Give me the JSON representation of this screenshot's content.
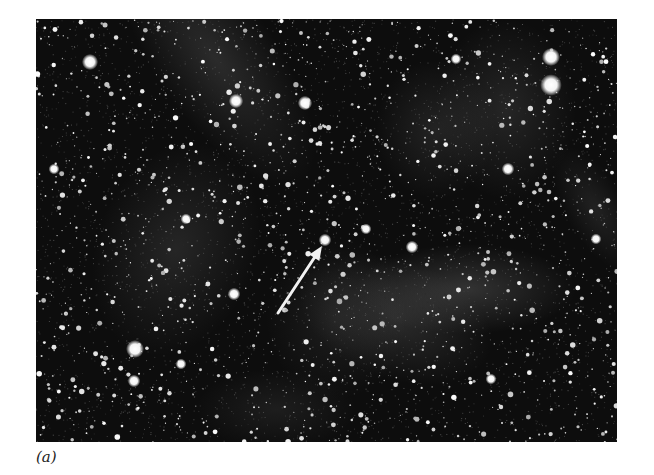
{
  "figure": {
    "panel_label": "(a)",
    "image": {
      "x": 36,
      "y": 19,
      "width": 581,
      "height": 423,
      "background_color": "#0d0d0d",
      "star_color": "#ffffff",
      "nebula_color": "#8a8a8a"
    },
    "arrow": {
      "color": "#f2f2f2",
      "tail": [
        242,
        294
      ],
      "head": [
        286,
        227
      ],
      "target_star": [
        289,
        221
      ]
    },
    "bright_stars": [
      [
        54,
        43,
        4.5
      ],
      [
        99,
        330,
        5
      ],
      [
        200,
        82,
        4
      ],
      [
        269,
        84,
        4
      ],
      [
        515,
        66,
        6
      ],
      [
        515,
        38,
        5
      ],
      [
        98,
        362,
        3.5
      ],
      [
        198,
        275,
        3.5
      ],
      [
        18,
        150,
        3
      ],
      [
        376,
        228,
        3.5
      ],
      [
        289,
        221,
        3.5
      ],
      [
        145,
        345,
        3
      ],
      [
        455,
        360,
        3
      ],
      [
        560,
        220,
        3
      ],
      [
        330,
        210,
        3
      ],
      [
        472,
        150,
        3.5
      ],
      [
        420,
        40,
        3
      ],
      [
        150,
        200,
        3
      ]
    ],
    "nebula_patches": [
      [
        180,
        40,
        60,
        150,
        -35,
        0.22
      ],
      [
        140,
        230,
        80,
        110,
        20,
        0.18
      ],
      [
        430,
        270,
        110,
        45,
        0,
        0.28
      ],
      [
        360,
        300,
        100,
        60,
        20,
        0.22
      ],
      [
        470,
        90,
        70,
        90,
        0,
        0.18
      ],
      [
        400,
        110,
        60,
        70,
        0,
        0.16
      ],
      [
        300,
        300,
        70,
        80,
        0,
        0.12
      ],
      [
        560,
        190,
        30,
        70,
        -30,
        0.15
      ],
      [
        240,
        390,
        80,
        40,
        0,
        0.12
      ]
    ],
    "random_star_count": 1500,
    "random_seed": 7
  }
}
